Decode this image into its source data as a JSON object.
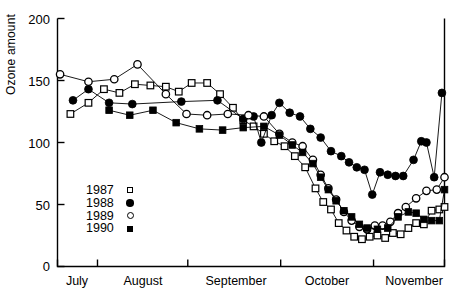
{
  "chart_data": {
    "type": "line",
    "title": "",
    "xlabel": "",
    "ylabel": "Ozone amount",
    "ylim": [
      0,
      200
    ],
    "yticks": [
      0,
      50,
      100,
      150,
      200
    ],
    "xticklabels": [
      "July",
      "August",
      "September",
      "October",
      "November"
    ],
    "xlim": [
      0,
      150
    ],
    "grid": false,
    "legend_position": "lower-left-inside",
    "series": [
      {
        "name": "1987",
        "marker": "open-square",
        "points": [
          {
            "x": 5,
            "y": 123
          },
          {
            "x": 12,
            "y": 132
          },
          {
            "x": 18,
            "y": 143
          },
          {
            "x": 24,
            "y": 140
          },
          {
            "x": 30,
            "y": 147
          },
          {
            "x": 36,
            "y": 146
          },
          {
            "x": 42,
            "y": 145
          },
          {
            "x": 47,
            "y": 141
          },
          {
            "x": 52,
            "y": 148
          },
          {
            "x": 58,
            "y": 148
          },
          {
            "x": 63,
            "y": 139
          },
          {
            "x": 68,
            "y": 128
          },
          {
            "x": 72,
            "y": 118
          },
          {
            "x": 76,
            "y": 113
          },
          {
            "x": 80,
            "y": 107
          },
          {
            "x": 84,
            "y": 101
          },
          {
            "x": 88,
            "y": 97
          },
          {
            "x": 92,
            "y": 89
          },
          {
            "x": 96,
            "y": 80
          },
          {
            "x": 100,
            "y": 63
          },
          {
            "x": 103,
            "y": 52
          },
          {
            "x": 106,
            "y": 46
          },
          {
            "x": 109,
            "y": 35
          },
          {
            "x": 112,
            "y": 29
          },
          {
            "x": 115,
            "y": 24
          },
          {
            "x": 118,
            "y": 22
          },
          {
            "x": 121,
            "y": 24
          },
          {
            "x": 124,
            "y": 25
          },
          {
            "x": 127,
            "y": 23
          },
          {
            "x": 130,
            "y": 27
          },
          {
            "x": 133,
            "y": 26
          },
          {
            "x": 136,
            "y": 31
          },
          {
            "x": 139,
            "y": 35
          },
          {
            "x": 142,
            "y": 34
          },
          {
            "x": 145,
            "y": 45
          },
          {
            "x": 148,
            "y": 46
          },
          {
            "x": 150,
            "y": 48
          }
        ]
      },
      {
        "name": "1988",
        "marker": "filled-circle",
        "points": [
          {
            "x": 6,
            "y": 134
          },
          {
            "x": 12,
            "y": 143
          },
          {
            "x": 20,
            "y": 132
          },
          {
            "x": 29,
            "y": 131
          },
          {
            "x": 48,
            "y": 133
          },
          {
            "x": 62,
            "y": 134
          },
          {
            "x": 72,
            "y": 119
          },
          {
            "x": 76,
            "y": 121
          },
          {
            "x": 79,
            "y": 100
          },
          {
            "x": 83,
            "y": 122
          },
          {
            "x": 86,
            "y": 132
          },
          {
            "x": 90,
            "y": 124
          },
          {
            "x": 94,
            "y": 121
          },
          {
            "x": 98,
            "y": 111
          },
          {
            "x": 102,
            "y": 104
          },
          {
            "x": 106,
            "y": 93
          },
          {
            "x": 110,
            "y": 89
          },
          {
            "x": 113,
            "y": 84
          },
          {
            "x": 116,
            "y": 80
          },
          {
            "x": 119,
            "y": 78
          },
          {
            "x": 122,
            "y": 58
          },
          {
            "x": 125,
            "y": 76
          },
          {
            "x": 128,
            "y": 74
          },
          {
            "x": 131,
            "y": 73
          },
          {
            "x": 134,
            "y": 73
          },
          {
            "x": 138,
            "y": 86
          },
          {
            "x": 141,
            "y": 101
          },
          {
            "x": 143,
            "y": 100
          },
          {
            "x": 146,
            "y": 72
          },
          {
            "x": 149,
            "y": 140
          }
        ]
      },
      {
        "name": "1989",
        "marker": "open-circle",
        "points": [
          {
            "x": 1,
            "y": 155
          },
          {
            "x": 12,
            "y": 149
          },
          {
            "x": 22,
            "y": 151
          },
          {
            "x": 31,
            "y": 163
          },
          {
            "x": 42,
            "y": 139
          },
          {
            "x": 50,
            "y": 123
          },
          {
            "x": 58,
            "y": 122
          },
          {
            "x": 66,
            "y": 123
          },
          {
            "x": 74,
            "y": 122
          },
          {
            "x": 80,
            "y": 121
          },
          {
            "x": 86,
            "y": 107
          },
          {
            "x": 91,
            "y": 100
          },
          {
            "x": 95,
            "y": 97
          },
          {
            "x": 99,
            "y": 86
          },
          {
            "x": 102,
            "y": 74
          },
          {
            "x": 105,
            "y": 63
          },
          {
            "x": 108,
            "y": 54
          },
          {
            "x": 111,
            "y": 44
          },
          {
            "x": 114,
            "y": 37
          },
          {
            "x": 117,
            "y": 32
          },
          {
            "x": 120,
            "y": 30
          },
          {
            "x": 123,
            "y": 33
          },
          {
            "x": 126,
            "y": 33
          },
          {
            "x": 129,
            "y": 36
          },
          {
            "x": 132,
            "y": 43
          },
          {
            "x": 135,
            "y": 48
          },
          {
            "x": 139,
            "y": 55
          },
          {
            "x": 143,
            "y": 61
          },
          {
            "x": 147,
            "y": 62
          },
          {
            "x": 150,
            "y": 72
          }
        ]
      },
      {
        "name": "1990",
        "marker": "filled-square",
        "points": [
          {
            "x": 20,
            "y": 126
          },
          {
            "x": 28,
            "y": 122
          },
          {
            "x": 37,
            "y": 126
          },
          {
            "x": 46,
            "y": 116
          },
          {
            "x": 55,
            "y": 111
          },
          {
            "x": 64,
            "y": 110
          },
          {
            "x": 72,
            "y": 112
          },
          {
            "x": 80,
            "y": 113
          },
          {
            "x": 86,
            "y": 106
          },
          {
            "x": 91,
            "y": 98
          },
          {
            "x": 95,
            "y": 92
          },
          {
            "x": 99,
            "y": 83
          },
          {
            "x": 102,
            "y": 72
          },
          {
            "x": 105,
            "y": 62
          },
          {
            "x": 108,
            "y": 53
          },
          {
            "x": 111,
            "y": 45
          },
          {
            "x": 114,
            "y": 40
          },
          {
            "x": 117,
            "y": 34
          },
          {
            "x": 120,
            "y": 31
          },
          {
            "x": 124,
            "y": 30
          },
          {
            "x": 128,
            "y": 31
          },
          {
            "x": 132,
            "y": 40
          },
          {
            "x": 136,
            "y": 44
          },
          {
            "x": 139,
            "y": 43
          },
          {
            "x": 142,
            "y": 38
          },
          {
            "x": 145,
            "y": 37
          },
          {
            "x": 148,
            "y": 37
          },
          {
            "x": 150,
            "y": 62
          }
        ]
      }
    ]
  },
  "axis": {
    "ytick_labels": [
      "200",
      "150",
      "100",
      "50",
      "0"
    ],
    "ylabel": "Ozone amount",
    "month_labels": [
      "July",
      "August",
      "September",
      "October",
      "November"
    ]
  },
  "legend": {
    "items": [
      {
        "label": "1987",
        "marker": "open-square"
      },
      {
        "label": "1988",
        "marker": "filled-circle"
      },
      {
        "label": "1989",
        "marker": "open-circle"
      },
      {
        "label": "1990",
        "marker": "filled-square"
      }
    ]
  }
}
